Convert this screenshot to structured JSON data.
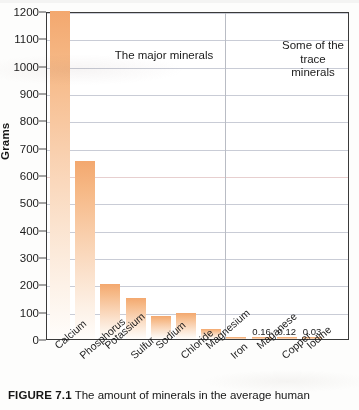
{
  "chart_data": {
    "type": "bar",
    "title": "",
    "xlabel": "",
    "ylabel": "Grams",
    "ylim": [
      0,
      1200
    ],
    "yticks": [
      0,
      100,
      200,
      300,
      400,
      500,
      600,
      700,
      800,
      900,
      1000,
      1100,
      1200
    ],
    "grid": true,
    "legend_position": "none",
    "categories": [
      "Calcium",
      "Phosphorus",
      "Potassium",
      "Sulfur",
      "Sodium",
      "Chloride",
      "Magnesium",
      "Iron",
      "Maganese",
      "Copper",
      "Iodine"
    ],
    "values": [
      1200,
      650,
      200,
      150,
      85,
      95,
      35,
      4,
      0.16,
      0.12,
      0.03
    ],
    "data_labels": [
      "",
      "",
      "",
      "",
      "",
      "",
      "",
      "",
      "0.16",
      "0.12",
      "0.03"
    ],
    "annotations": [
      {
        "text": "The major minerals",
        "group": "major"
      },
      {
        "text": "Some of the\ntrace minerals",
        "group": "trace"
      }
    ],
    "group_divider_after": "Magnesium",
    "bar_color": "#f3a86f",
    "gridline_color": "#c9ccd6",
    "axis_color": "#3a3a3a"
  },
  "axis": {
    "y_title": "Grams",
    "tick_labels": [
      "1200",
      "1100",
      "1000",
      "900",
      "800",
      "700",
      "600",
      "500",
      "400",
      "300",
      "200",
      "100",
      "0"
    ]
  },
  "annotations": {
    "major": "The major minerals",
    "trace": "Some of the\ntrace minerals"
  },
  "caption": {
    "figure_number": "FIGURE 7.1",
    "text": " The amount of minerals in the average human"
  }
}
